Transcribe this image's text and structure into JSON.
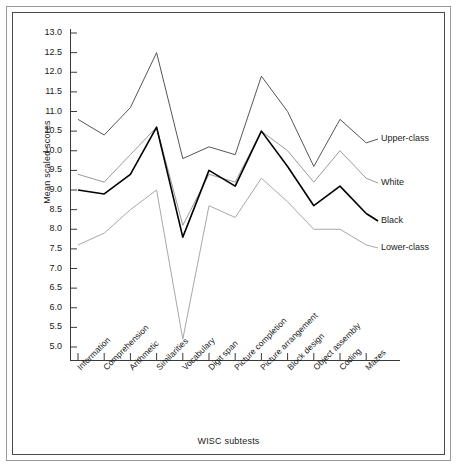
{
  "chart_data": {
    "type": "line",
    "title": "",
    "xlabel": "WISC subtests",
    "ylabel": "Mean scaled scores",
    "ylim": [
      5.0,
      13.0
    ],
    "ytick_labels": [
      "13.0",
      "12.5",
      "12.0",
      "11.5",
      "11.0",
      "10.5",
      "10.0",
      "9.5",
      "9.0",
      "8.5",
      "8.0",
      "7.5",
      "7.0",
      "6.5",
      "6.0",
      "5.5",
      "5.0"
    ],
    "ytick_values": [
      13.0,
      12.5,
      12.0,
      11.5,
      11.0,
      10.5,
      10.0,
      9.5,
      9.0,
      8.5,
      8.0,
      7.5,
      7.0,
      6.5,
      6.0,
      5.5,
      5.0
    ],
    "grid": false,
    "legend_position": "right",
    "categories": [
      "Information",
      "Comprehension",
      "Arithmetic",
      "Similarities",
      "Vocabulary",
      "Digit span",
      "Picture completion",
      "Picture arrangement",
      "Block design",
      "Object assembly",
      "Coding",
      "Mazes"
    ],
    "series": [
      {
        "name": "Upper-class",
        "color": "#555555",
        "values": [
          10.8,
          10.4,
          11.1,
          12.5,
          9.8,
          10.1,
          9.9,
          11.9,
          11.0,
          9.6,
          10.8,
          10.2
        ]
      },
      {
        "name": "White",
        "color": "#9a9a9a",
        "values": [
          9.4,
          9.2,
          9.9,
          10.6,
          8.1,
          9.4,
          9.2,
          10.5,
          10.0,
          9.2,
          10.0,
          9.3
        ]
      },
      {
        "name": "Black",
        "color": "#000000",
        "values": [
          9.0,
          8.9,
          9.4,
          10.6,
          7.8,
          9.5,
          9.1,
          10.5,
          9.6,
          8.6,
          9.1,
          8.4
        ]
      },
      {
        "name": "Lower-class",
        "color": "#a8a8a8",
        "values": [
          7.6,
          7.9,
          8.5,
          9.0,
          5.2,
          8.6,
          8.3,
          9.3,
          8.7,
          8.0,
          8.0,
          7.6
        ]
      }
    ]
  },
  "legend": {
    "items": [
      {
        "label": "Upper-class"
      },
      {
        "label": "White"
      },
      {
        "label": "Black"
      },
      {
        "label": "Lower-class"
      }
    ]
  }
}
